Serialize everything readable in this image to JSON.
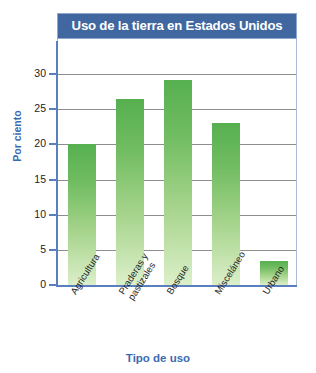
{
  "chart_data": {
    "type": "bar",
    "title": "Uso de la tierra en Estados Unidos",
    "xlabel": "Tipo de uso",
    "ylabel": "Por ciento",
    "categories": [
      "Agricultura",
      "Praderas y pastizales",
      "Bosque",
      "Misceláneo",
      "Urbano"
    ],
    "category_lines": [
      [
        "Agricultura"
      ],
      [
        "Praderas y",
        "pastizales"
      ],
      [
        "Bosque"
      ],
      [
        "Misceláneo"
      ],
      [
        "Urbano"
      ]
    ],
    "values": [
      20,
      26.4,
      29.2,
      23,
      3.4
    ],
    "ylim": [
      0,
      30
    ],
    "yticks": [
      0,
      5,
      10,
      15,
      20,
      25,
      30
    ],
    "ytick_labels": [
      "0",
      "5",
      "10",
      "15",
      "20",
      "25",
      "30"
    ],
    "grid": true,
    "legend": false,
    "legend_position": "none",
    "units": "percent"
  },
  "colors": {
    "title_banner": "#40679f",
    "title_text": "#ffffff",
    "axis_label": "#3a6bb0",
    "axis_spine": "#5a7fbf",
    "gridline": "#8d8d8d",
    "bar_top": "#56b04f",
    "bar_bottom": "#dcefc9",
    "frame_border": "#a9bcd8",
    "tick_text": "#1b1b1b",
    "category_text": "#1f1f1f",
    "background": "#ffffff"
  }
}
